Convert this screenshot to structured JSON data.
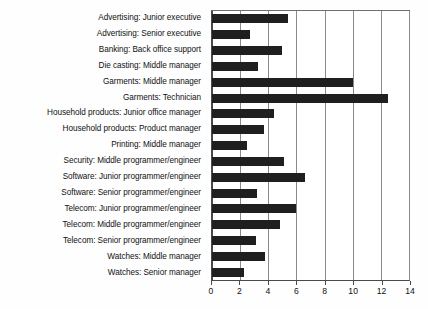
{
  "chart_data": {
    "type": "bar",
    "orientation": "horizontal",
    "title": "",
    "xlabel": "",
    "ylabel": "",
    "xlim": [
      0,
      14
    ],
    "xticks": [
      0,
      2,
      4,
      6,
      8,
      10,
      12,
      14
    ],
    "xtick_labels": [
      "0",
      "2",
      "4",
      "6",
      "8",
      "10",
      "12",
      "14"
    ],
    "grid": true,
    "grid_axis": "x",
    "legend": false,
    "bar_color": "#1f1f1f",
    "categories": [
      "Advertising: Junior executive",
      "Advertising: Senior executive",
      "Banking: Back office support",
      "Die casting: Middle manager",
      "Garments: Middle manager",
      "Garments: Technician",
      "Household products: Junior office manager",
      "Household products: Product manager",
      "Printing: Middle manager",
      "Security: Middle programmer/engineer",
      "Software: Junior programmer/engineer",
      "Software: Senior programmer/engineer",
      "Telecom: Junior programmer/engineer",
      "Telecom: Middle programmer/engineer",
      "Telecom: Senior programmer/engineer",
      "Watches: Middle manager",
      "Watches: Senior manager"
    ],
    "values": [
      5.4,
      2.7,
      5.0,
      3.3,
      10.0,
      12.5,
      4.4,
      3.7,
      2.5,
      5.1,
      6.6,
      3.2,
      6.0,
      4.8,
      3.1,
      3.8,
      2.3
    ]
  }
}
